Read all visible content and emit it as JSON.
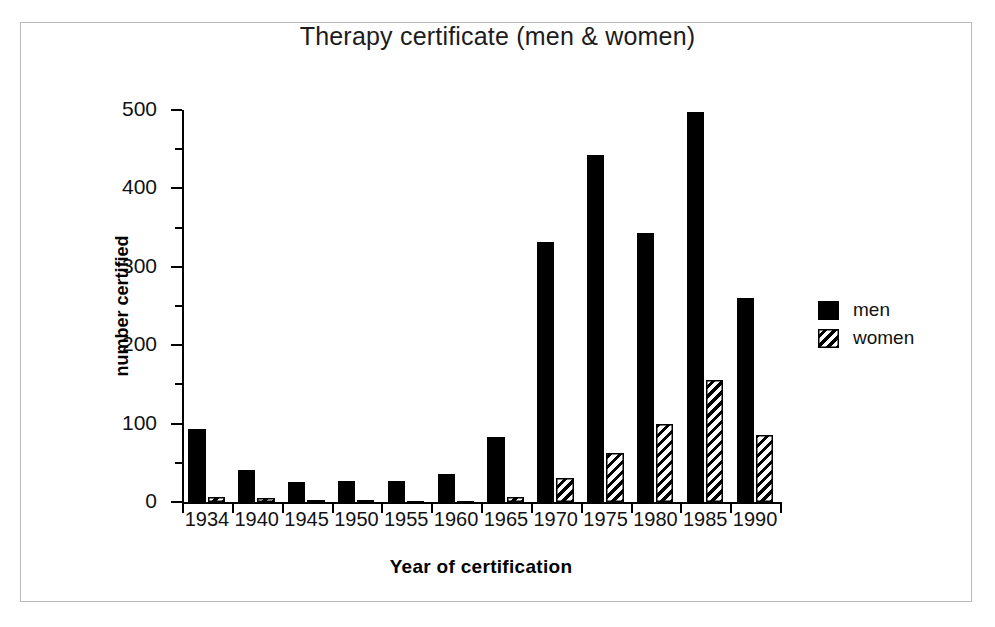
{
  "chart_data": {
    "type": "bar",
    "title": "Therapy certificate (men & women)",
    "xlabel": "Year of certification",
    "ylabel": "number certified",
    "categories": [
      "1934",
      "1940",
      "1945",
      "1950",
      "1955",
      "1960",
      "1965",
      "1970",
      "1975",
      "1980",
      "1985",
      "1990"
    ],
    "series": [
      {
        "name": "men",
        "color": "#000000",
        "pattern": "solid",
        "values": [
          93,
          41,
          26,
          27,
          27,
          36,
          83,
          332,
          442,
          343,
          498,
          260
        ]
      },
      {
        "name": "women",
        "color": "#000000",
        "pattern": "diagonal-hatch",
        "values": [
          6,
          5,
          3,
          2,
          1,
          1,
          7,
          30,
          63,
          100,
          155,
          86
        ]
      }
    ],
    "ylim": [
      0,
      500
    ],
    "y_ticks_major": [
      0,
      100,
      200,
      300,
      400,
      500
    ],
    "y_ticks_minor": [
      50,
      150,
      250,
      350,
      450
    ],
    "y_tick_labels": [
      "0",
      "100",
      "200",
      "300",
      "400",
      "500"
    ],
    "grid": false,
    "legend_position": "right"
  },
  "legend": {
    "entries": [
      {
        "label": "men"
      },
      {
        "label": "women"
      }
    ]
  },
  "colors": {
    "ink": "#000000",
    "frame": "#b9b9b9",
    "background": "#ffffff"
  }
}
